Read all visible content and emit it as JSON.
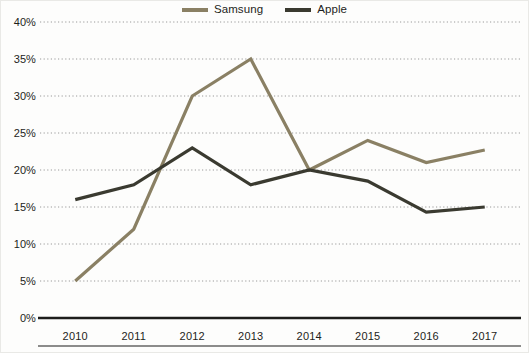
{
  "chart_data": {
    "type": "line",
    "title": "",
    "subtitle": "",
    "xlabel": "",
    "ylabel": "",
    "x": [
      "2010",
      "2011",
      "2012",
      "2013",
      "2014",
      "2015",
      "2016",
      "2017"
    ],
    "categories": [
      "2010",
      "2011",
      "2012",
      "2013",
      "2014",
      "2015",
      "2016",
      "2017"
    ],
    "series": [
      {
        "name": "Samsung",
        "color": "#8a8064",
        "values": [
          5,
          12,
          30,
          35,
          20,
          24,
          21,
          22.7
        ]
      },
      {
        "name": "Apple",
        "color": "#3a3a30",
        "values": [
          16,
          18,
          23,
          18,
          20,
          18.5,
          14.3,
          15
        ]
      }
    ],
    "ylim": [
      0,
      40
    ],
    "yticks": [
      0,
      5,
      10,
      15,
      20,
      25,
      30,
      35,
      40
    ],
    "ytick_labels": [
      "0%",
      "5%",
      "10%",
      "15%",
      "20%",
      "25%",
      "30%",
      "35%",
      "40%"
    ],
    "xtick_labels": [
      "2010",
      "2011",
      "2012",
      "2013",
      "2014",
      "2015",
      "2016",
      "2017"
    ],
    "grid": true,
    "grid_style": "dotted",
    "grid_color": "#9a9a9a",
    "legend_position": "top-center",
    "axis_line_color": "#1d1d1b",
    "background": "#fdfdfc"
  },
  "legend": {
    "entries": [
      {
        "label": "Samsung",
        "color": "#8a8064"
      },
      {
        "label": "Apple",
        "color": "#3a3a30"
      }
    ]
  },
  "axes": {
    "y": {
      "ticks": [
        {
          "label": "40%",
          "value": 40
        },
        {
          "label": "35%",
          "value": 35
        },
        {
          "label": "30%",
          "value": 30
        },
        {
          "label": "25%",
          "value": 25
        },
        {
          "label": "20%",
          "value": 20
        },
        {
          "label": "15%",
          "value": 15
        },
        {
          "label": "10%",
          "value": 10
        },
        {
          "label": "5%",
          "value": 5
        },
        {
          "label": "0%",
          "value": 0
        }
      ]
    },
    "x": {
      "ticks": [
        {
          "label": "2010"
        },
        {
          "label": "2011"
        },
        {
          "label": "2012"
        },
        {
          "label": "2013"
        },
        {
          "label": "2014"
        },
        {
          "label": "2015"
        },
        {
          "label": "2016"
        },
        {
          "label": "2017"
        }
      ]
    }
  }
}
